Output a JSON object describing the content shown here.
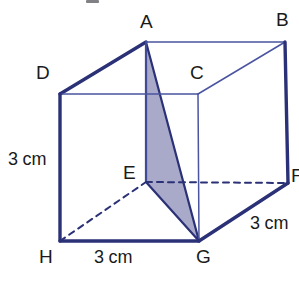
{
  "figure": {
    "shape": "cube",
    "colors": {
      "edge": "#2b3176",
      "edge_thin": "#4a54a0",
      "hidden_edge": "#2b3176",
      "shade_fill": "#a9a9c9",
      "shade_stroke": "#2b3176",
      "background": "#ffffff",
      "label_text": "#1a1a1a"
    },
    "vertices": [
      {
        "name": "A",
        "x": 146,
        "y": 42,
        "label_x": 140,
        "label_y": 12,
        "hidden": false
      },
      {
        "name": "B",
        "x": 285,
        "y": 42,
        "label_x": 276,
        "label_y": 10,
        "hidden": false
      },
      {
        "name": "C",
        "x": 198,
        "y": 94,
        "label_x": 190,
        "label_y": 63,
        "hidden": false
      },
      {
        "name": "D",
        "x": 60,
        "y": 94,
        "label_x": 36,
        "label_y": 63,
        "hidden": false
      },
      {
        "name": "E",
        "x": 146,
        "y": 182,
        "label_x": 123,
        "label_y": 163,
        "hidden": true
      },
      {
        "name": "F",
        "x": 288,
        "y": 183,
        "label_x": 291,
        "label_y": 166,
        "hidden": false
      },
      {
        "name": "G",
        "x": 199,
        "y": 241,
        "label_x": 196,
        "label_y": 247,
        "hidden": false
      },
      {
        "name": "H",
        "x": 60,
        "y": 241,
        "label_x": 39,
        "label_y": 247,
        "hidden": false
      }
    ],
    "edges": [
      {
        "from": "D",
        "to": "A",
        "style": "solid",
        "weight": "thick"
      },
      {
        "from": "A",
        "to": "B",
        "style": "solid",
        "weight": "thin"
      },
      {
        "from": "B",
        "to": "C",
        "style": "solid",
        "weight": "thin"
      },
      {
        "from": "C",
        "to": "D",
        "style": "solid",
        "weight": "thin"
      },
      {
        "from": "D",
        "to": "H",
        "style": "solid",
        "weight": "thick"
      },
      {
        "from": "A",
        "to": "E",
        "style": "solid",
        "weight": "thin"
      },
      {
        "from": "B",
        "to": "F",
        "style": "solid",
        "weight": "thick"
      },
      {
        "from": "C",
        "to": "G",
        "style": "solid",
        "weight": "thin"
      },
      {
        "from": "H",
        "to": "G",
        "style": "solid",
        "weight": "thick"
      },
      {
        "from": "G",
        "to": "F",
        "style": "solid",
        "weight": "thick"
      },
      {
        "from": "H",
        "to": "E",
        "style": "dashed",
        "weight": "thin"
      },
      {
        "from": "E",
        "to": "F",
        "style": "dashed",
        "weight": "thin"
      }
    ],
    "shaded_face": {
      "vertices": [
        "A",
        "E",
        "G"
      ],
      "fill": "#a9a9c9",
      "stroke": "#2b3176"
    },
    "dimensions": [
      {
        "id": "height",
        "text": "3 cm",
        "x": 8,
        "y": 150,
        "edge": "D-H"
      },
      {
        "id": "width",
        "text": "3 cm",
        "x": 94,
        "y": 248,
        "edge": "H-G"
      },
      {
        "id": "depth",
        "text": "3 cm",
        "x": 250,
        "y": 214,
        "edge": "G-F"
      }
    ]
  }
}
